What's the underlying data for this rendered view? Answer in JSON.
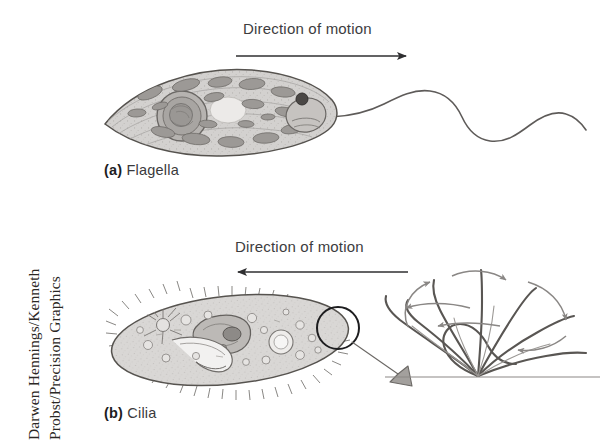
{
  "figure": {
    "background_color": "#ffffff",
    "ink_color": "#3a3a3c",
    "cell_fill": "#cfcdcb",
    "cell_stroke": "#5a5755",
    "organelle_fill": "#9a9794"
  },
  "credit": {
    "line1": "Darwen Hennings/Kenneth",
    "line2": "Probst/Precision Graphics"
  },
  "panels": [
    {
      "tag": "(a)",
      "title": "Flagella",
      "direction_caption": "Direction of motion",
      "arrow_direction": "right",
      "organism": "flagellate",
      "features": [
        "nucleus",
        "eyespot",
        "reservoir",
        "mitochondria",
        "chloroplasts",
        "flagellum"
      ]
    },
    {
      "tag": "(b)",
      "title": "Cilia",
      "direction_caption": "Direction of motion",
      "arrow_direction": "left",
      "organism": "ciliate",
      "features": [
        "cilia-fringe",
        "contractile-vacuole",
        "macronucleus",
        "micronucleus",
        "oral-groove",
        "food-vacuole",
        "callout-circle",
        "cilia-beat-detail"
      ]
    }
  ],
  "labels": {
    "panel_a": "(a) Flagella",
    "panel_b": "(b) Cilia",
    "direction_of_motion": "Direction of motion"
  },
  "icons": {
    "arrow_right": "arrow-right-icon",
    "arrow_left": "arrow-left-icon",
    "callout_circle": "callout-circle-icon",
    "callout_pointer": "callout-pointer-icon",
    "beat_arrow": "beat-arrow-icon"
  }
}
